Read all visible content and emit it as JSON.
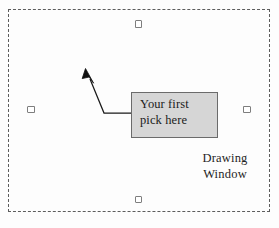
{
  "figure": {
    "drawing_window": {
      "label_line_1": "Drawing",
      "label_line_2": "Window",
      "border_style": "dashed",
      "border_color": "#5d5d5d"
    },
    "callout": {
      "line_1": "Your first",
      "line_2": "pick here",
      "fill_color": "#d6d6d6",
      "border_color": "#6b6b6b"
    },
    "leader": {
      "arrow_color": "#1a1a1a",
      "description": "leader-line-with-arrowhead"
    },
    "grips": [
      {
        "name": "grip-top",
        "position": "top-center"
      },
      {
        "name": "grip-bottom",
        "position": "bottom-center"
      },
      {
        "name": "grip-left",
        "position": "left-middle"
      },
      {
        "name": "grip-right",
        "position": "right-middle"
      }
    ],
    "caption": ""
  }
}
